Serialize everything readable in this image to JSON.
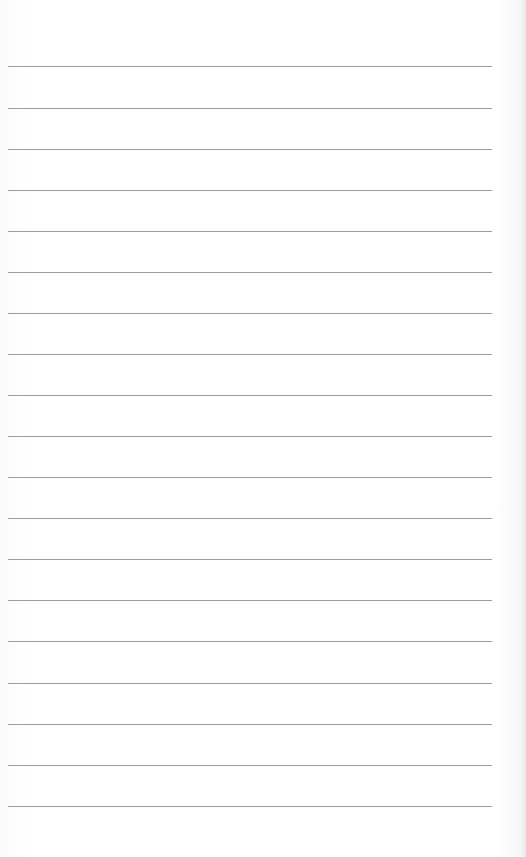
{
  "page": {
    "type": "blank ruled sheet",
    "line_count": 18,
    "line_color": "#8c8c8c",
    "background_color": "#ffffff",
    "first_line_y": 66,
    "line_spacing": 41,
    "line_left": 8,
    "line_width": 484
  },
  "lines": [
    {
      "y": 66
    },
    {
      "y": 108
    },
    {
      "y": 149
    },
    {
      "y": 190
    },
    {
      "y": 231
    },
    {
      "y": 272
    },
    {
      "y": 313
    },
    {
      "y": 354
    },
    {
      "y": 395
    },
    {
      "y": 436
    },
    {
      "y": 477
    },
    {
      "y": 518
    },
    {
      "y": 559
    },
    {
      "y": 600
    },
    {
      "y": 641
    },
    {
      "y": 683
    },
    {
      "y": 724
    },
    {
      "y": 765
    },
    {
      "y": 806
    }
  ]
}
